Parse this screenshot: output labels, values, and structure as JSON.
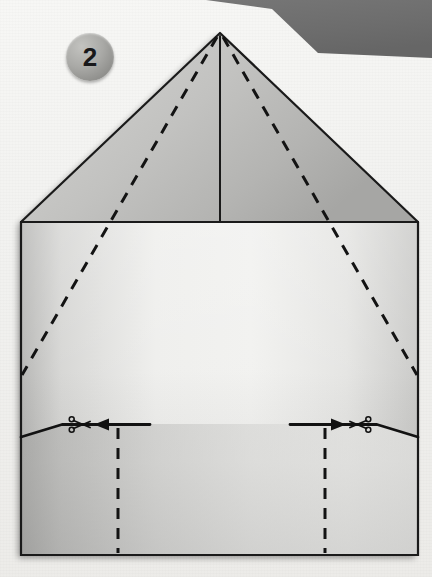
{
  "diagram": {
    "step_number": "2",
    "step_badge_color": "#9a9a97",
    "step_number_color": "#18181a",
    "background_color": "#f2f2f0",
    "outline_color": "#1a1a1a",
    "canvas": {
      "width": 432,
      "height": 577
    }
  },
  "corner_band": {
    "name": "top-right-dark-band",
    "color": "#6e6e6e",
    "points": "208,0 432,0 432,56 320,52 276,11"
  },
  "paper": {
    "name": "folded-paper-sheet",
    "apex": {
      "x": 220,
      "y": 33
    },
    "roof_left_corner": {
      "x": 23,
      "y": 222
    },
    "roof_right_corner": {
      "x": 418,
      "y": 222
    },
    "bottom_left_corner": {
      "x": 21,
      "y": 555
    },
    "bottom_right_corner": {
      "x": 418,
      "y": 555
    },
    "roof_fill_light": "#e3e3e1",
    "roof_fill_dark": "#9d9d9b",
    "body_fill_light": "#f0f0ee",
    "body_fill_dark": "#9b9b99",
    "outline_width": 2.2,
    "shadow_color": "rgba(90,90,90,0.30)"
  },
  "fold_lines": {
    "center_crease": {
      "name": "center-vertical-crease",
      "style": "solid",
      "from": {
        "x": 220,
        "y": 33
      },
      "to": {
        "x": 220,
        "y": 222
      }
    },
    "diagonal_left": {
      "name": "left-diagonal-fold",
      "style": "dashed",
      "from": {
        "x": 218,
        "y": 36
      },
      "to": {
        "x": 22,
        "y": 375
      }
    },
    "diagonal_right": {
      "name": "right-diagonal-fold",
      "style": "dashed",
      "from": {
        "x": 222,
        "y": 36
      },
      "to": {
        "x": 417,
        "y": 375
      }
    },
    "vertical_left": {
      "name": "left-vertical-fold",
      "style": "dashed",
      "from": {
        "x": 118,
        "y": 428
      },
      "to": {
        "x": 118,
        "y": 553
      }
    },
    "vertical_right": {
      "name": "right-vertical-fold",
      "style": "dashed",
      "from": {
        "x": 325,
        "y": 428
      },
      "to": {
        "x": 325,
        "y": 553
      }
    },
    "dash_pattern": "11 9",
    "dash_width": 3.0
  },
  "cut_marks": {
    "left": {
      "name": "left-cut-line",
      "edge_path": "21,436 62,424 145,424",
      "arrow_from": {
        "x": 145,
        "y": 424
      },
      "arrow_to": {
        "x": 96,
        "y": 424
      },
      "scissors_at": {
        "x": 78,
        "y": 424
      },
      "direction": "left"
    },
    "right": {
      "name": "right-cut-line",
      "edge_path": "418,436 377,424 295,424",
      "arrow_from": {
        "x": 295,
        "y": 424
      },
      "arrow_to": {
        "x": 344,
        "y": 424
      },
      "scissors_at": {
        "x": 362,
        "y": 424
      },
      "direction": "right"
    },
    "icon": "scissors-icon",
    "line_width": 2.6
  }
}
